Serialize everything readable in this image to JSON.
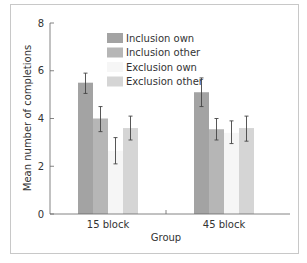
{
  "chart_data": {
    "type": "bar",
    "title": "",
    "xlabel": "Group",
    "ylabel": "Mean number of completions",
    "ylim": [
      0,
      8
    ],
    "yticks": [
      0,
      2,
      4,
      6,
      8
    ],
    "grid": false,
    "legend_position": "upper-center-inside",
    "categories": [
      "15 block",
      "45 block"
    ],
    "series": [
      {
        "name": "Inclusion own",
        "color": "#a3a3a3",
        "values": [
          5.5,
          5.1
        ],
        "error_low": [
          5.05,
          4.5
        ],
        "error_high": [
          5.9,
          5.7
        ]
      },
      {
        "name": "Inclusion other",
        "color": "#b6b6b6",
        "values": [
          4.0,
          3.55
        ],
        "error_low": [
          3.45,
          3.1
        ],
        "error_high": [
          4.5,
          4.0
        ]
      },
      {
        "name": "Exclusion own",
        "color": "#f6f6f6",
        "values": [
          2.65,
          3.4
        ],
        "error_low": [
          2.1,
          2.95
        ],
        "error_high": [
          3.2,
          3.9
        ]
      },
      {
        "name": "Exclusion other",
        "color": "#d5d5d5",
        "values": [
          3.6,
          3.6
        ],
        "error_low": [
          3.1,
          3.05
        ],
        "error_high": [
          4.1,
          4.1
        ]
      }
    ]
  }
}
